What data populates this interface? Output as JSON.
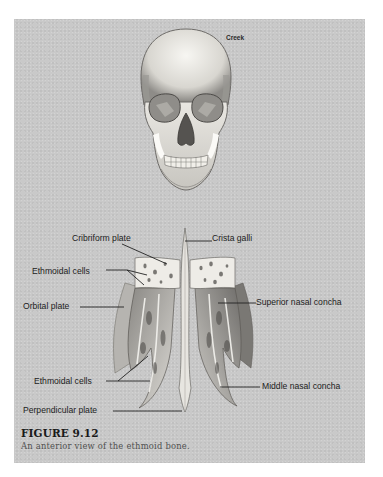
{
  "figure": {
    "number": "FIGURE 9.12",
    "caption": "An anterior view of the ethmoid bone.",
    "credit": "Creek"
  },
  "illustrations": {
    "skull": "anterior view of human skull",
    "ethmoid": "anterior view of isolated ethmoid bone"
  },
  "labels": {
    "cribriform_plate": "Cribriform plate",
    "crista_galli": "Crista galli",
    "ethmoidal_cells_upper": "Ethmoidal cells",
    "orbital_plate": "Orbital plate",
    "superior_nasal_concha": "Superior nasal concha",
    "ethmoidal_cells_lower": "Ethmoidal cells",
    "middle_nasal_concha": "Middle nasal concha",
    "perpendicular_plate": "Perpendicular plate"
  },
  "colors": {
    "panel_background": "#c9c9c9",
    "bone_light": "#ebe9e4",
    "bone_shadow": "#6f6f6f",
    "label_text": "#1c1c1c"
  }
}
